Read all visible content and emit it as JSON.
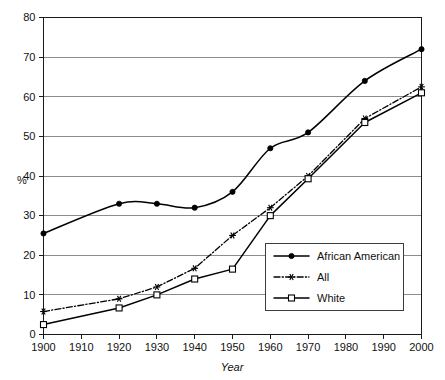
{
  "chart_data": {
    "type": "line",
    "title": "",
    "subtitle": "",
    "xlabel": "Year",
    "ylabel": "%",
    "xlim": [
      1900,
      2000
    ],
    "ylim": [
      0,
      80
    ],
    "grid": "horizontal",
    "legend_position": "inside-lower-right",
    "x_ticks": [
      1900,
      1910,
      1920,
      1930,
      1940,
      1950,
      1960,
      1970,
      1980,
      1990,
      2000
    ],
    "x_tick_labels": [
      "1900",
      "1910",
      "1920",
      "1930",
      "1940",
      "1950",
      "1960",
      "1970",
      "1980",
      "1990",
      "2000"
    ],
    "y_ticks": [
      0,
      10,
      20,
      30,
      40,
      50,
      60,
      70,
      80
    ],
    "y_tick_labels": [
      "0",
      "10",
      "20",
      "30",
      "40",
      "50",
      "60",
      "70",
      "80"
    ],
    "series": [
      {
        "name": "African American",
        "marker": "filled-circle",
        "linestyle": "solid",
        "smoothed": true,
        "x": [
          1900,
          1920,
          1930,
          1940,
          1950,
          1960,
          1970,
          1985,
          2000
        ],
        "values": [
          25.5,
          33,
          33,
          32,
          36,
          47,
          51,
          64,
          72
        ]
      },
      {
        "name": "All",
        "marker": "asterisk",
        "linestyle": "dash-dot",
        "smoothed": false,
        "x": [
          1900,
          1920,
          1930,
          1940,
          1950,
          1960,
          1970,
          1985,
          2000
        ],
        "values": [
          5.8,
          9,
          12,
          16.7,
          25,
          32,
          40,
          54.5,
          62.5
        ]
      },
      {
        "name": "White",
        "marker": "open-square",
        "linestyle": "solid",
        "smoothed": false,
        "x": [
          1900,
          1920,
          1930,
          1940,
          1950,
          1960,
          1970,
          1985,
          2000
        ],
        "values": [
          2.5,
          6.7,
          10,
          14,
          16.5,
          30,
          39.3,
          53.5,
          61
        ]
      }
    ]
  },
  "legend": {
    "entries": [
      {
        "label": "African American"
      },
      {
        "label": "All"
      },
      {
        "label": "White"
      }
    ]
  },
  "colors": {
    "line": "#000000",
    "grid": "#6f6f6f",
    "frame": "#1a1a1a",
    "text": "#111111",
    "background": "#ffffff"
  }
}
